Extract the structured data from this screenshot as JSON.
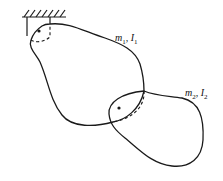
{
  "diagram": {
    "type": "compound double pendulum",
    "body1": {
      "mass_symbol": "m",
      "mass_sub": "1",
      "inertia_symbol": "I",
      "inertia_sub": "1",
      "sep": ", "
    },
    "body2": {
      "mass_symbol": "m",
      "mass_sub": "2",
      "inertia_symbol": "I",
      "inertia_sub": "2",
      "sep": ", "
    },
    "colors": {
      "stroke": "#1a1a1a",
      "background": "#ffffff"
    }
  }
}
